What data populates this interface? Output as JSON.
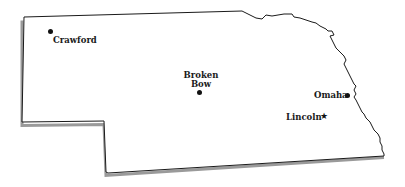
{
  "map": {
    "region": "Nebraska",
    "colors": {
      "border": "#1a1a1a",
      "shadow": "#9a9a9a",
      "fill": "#ffffff",
      "marker": "#111111"
    },
    "cities": [
      {
        "name": "Crawford",
        "marker": "dot",
        "x": 47,
        "y": 31
      },
      {
        "name": "Broken Bow",
        "line1": "Broken",
        "line2": "Bow",
        "marker": "dot",
        "x": 200,
        "y": 91
      },
      {
        "name": "Omaha",
        "marker": "dot",
        "x": 347,
        "y": 95
      },
      {
        "name": "Lincoln",
        "marker": "star",
        "x": 324,
        "y": 117
      }
    ]
  }
}
